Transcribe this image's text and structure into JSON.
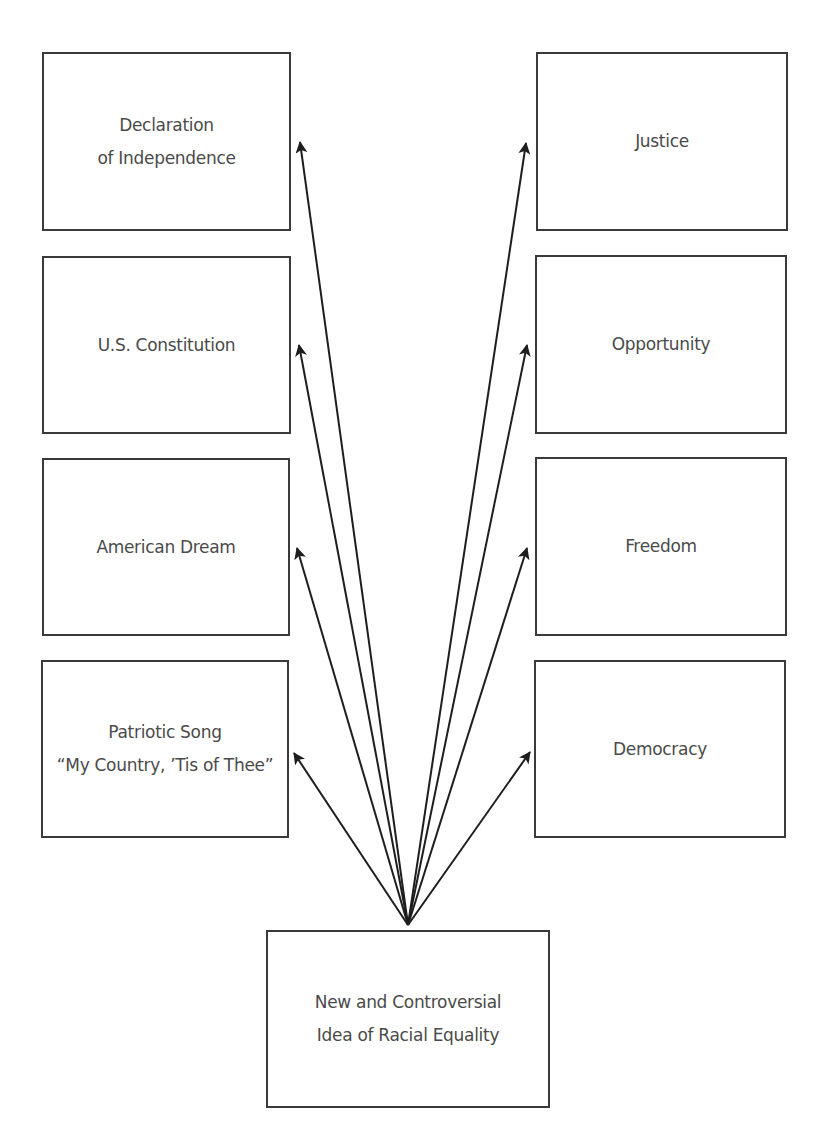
{
  "diagram": {
    "source_node": {
      "label": "New and Controversial\nIdea of Racial Equality",
      "box": {
        "x": 266,
        "y": 930,
        "w": 284,
        "h": 178
      }
    },
    "convergence_point": {
      "x": 408,
      "y": 925
    },
    "left_column": [
      {
        "label": "Declaration\nof Independence",
        "box": {
          "x": 42,
          "y": 52,
          "w": 249,
          "h": 179
        },
        "arrow_tip": {
          "x": 300,
          "y": 142
        }
      },
      {
        "label": "U.S. Constitution",
        "box": {
          "x": 42,
          "y": 256,
          "w": 249,
          "h": 178
        },
        "arrow_tip": {
          "x": 299,
          "y": 345
        }
      },
      {
        "label": "American Dream",
        "box": {
          "x": 42,
          "y": 458,
          "w": 248,
          "h": 178
        },
        "arrow_tip": {
          "x": 297,
          "y": 548
        }
      },
      {
        "label": "Patriotic Song\n“My Country, ’Tis of Thee”",
        "box": {
          "x": 41,
          "y": 660,
          "w": 248,
          "h": 178
        },
        "arrow_tip": {
          "x": 294,
          "y": 753
        }
      }
    ],
    "right_column": [
      {
        "label": "Justice",
        "box": {
          "x": 536,
          "y": 52,
          "w": 252,
          "h": 179
        },
        "arrow_tip": {
          "x": 526,
          "y": 143
        }
      },
      {
        "label": "Opportunity",
        "box": {
          "x": 535,
          "y": 255,
          "w": 252,
          "h": 179
        },
        "arrow_tip": {
          "x": 527,
          "y": 345
        }
      },
      {
        "label": "Freedom",
        "box": {
          "x": 535,
          "y": 457,
          "w": 252,
          "h": 179
        },
        "arrow_tip": {
          "x": 527,
          "y": 548
        }
      },
      {
        "label": "Democracy",
        "box": {
          "x": 534,
          "y": 660,
          "w": 252,
          "h": 178
        },
        "arrow_tip": {
          "x": 530,
          "y": 752
        }
      }
    ],
    "colors": {
      "stroke": "#3a3a3a",
      "arrow": "#1e1e1e",
      "text": "#4a4a4a",
      "background": "#ffffff"
    }
  }
}
